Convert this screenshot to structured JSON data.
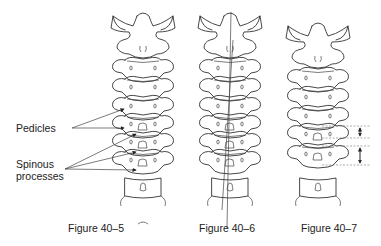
{
  "figures": [
    {
      "id": "40-5",
      "caption": "Figure 40–5"
    },
    {
      "id": "40-6",
      "caption": "Figure 40–6"
    },
    {
      "id": "40-7",
      "caption": "Figure 40–7"
    }
  ],
  "annotations": {
    "pedicles": "Pedicles",
    "spinous_processes_line1": "Spinous",
    "spinous_processes_line2": "processes"
  },
  "colors": {
    "line": "#333333",
    "background": "#ffffff"
  }
}
